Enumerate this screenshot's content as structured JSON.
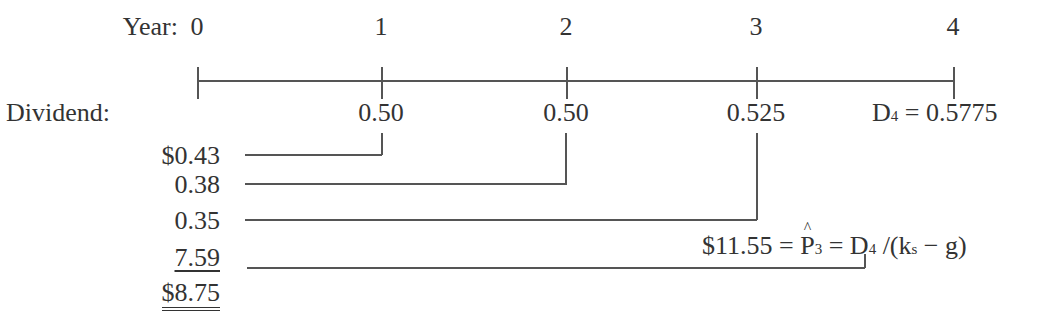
{
  "timeline": {
    "year_label": "Year:",
    "dividend_label": "Dividend:",
    "years": [
      "0",
      "1",
      "2",
      "3",
      "4"
    ],
    "dividends": [
      "",
      "0.50",
      "0.50",
      "0.525",
      "= 0.5775"
    ],
    "d4_symbol": "D",
    "d4_sub": "4"
  },
  "present_values": [
    {
      "value": "$0.43",
      "from_year": "1"
    },
    {
      "value": "0.38",
      "from_year": "2"
    },
    {
      "value": "0.35",
      "from_year": "3"
    },
    {
      "value": "7.59",
      "from_year": "3 (terminal price)"
    }
  ],
  "total": "$8.75",
  "terminal": {
    "value": "$11.55 =",
    "p_symbol": "P",
    "p_sub": "3",
    "eq": " = D",
    "d_sub": "4",
    "formula_rest": " /(k",
    "k_sub": "s",
    "formula_end": " − g)"
  }
}
